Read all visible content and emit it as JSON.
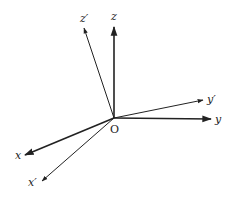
{
  "diagram": {
    "origin": {
      "label": "O",
      "x": 114,
      "y": 118
    },
    "axes": [
      {
        "id": "z",
        "label": "z",
        "tip": [
          114,
          27
        ],
        "label_pos": [
          111,
          20
        ],
        "weight": 1.6
      },
      {
        "id": "z-prime",
        "label": "z′",
        "tip": [
          84,
          28
        ],
        "label_pos": [
          80,
          22
        ],
        "weight": 1.0
      },
      {
        "id": "y-prime",
        "label": "y′",
        "tip": [
          203,
          100
        ],
        "label_pos": [
          207,
          103
        ],
        "weight": 1.0
      },
      {
        "id": "y",
        "label": "y",
        "tip": [
          211,
          119
        ],
        "label_pos": [
          215,
          123
        ],
        "weight": 1.6
      },
      {
        "id": "x",
        "label": "x",
        "tip": [
          25,
          155
        ],
        "label_pos": [
          15,
          159
        ],
        "weight": 1.6
      },
      {
        "id": "x-prime",
        "label": "x′",
        "tip": [
          42,
          181
        ],
        "label_pos": [
          28,
          186
        ],
        "weight": 1.0
      }
    ],
    "colors": {
      "axis": "#222222",
      "background": "#ffffff"
    }
  }
}
